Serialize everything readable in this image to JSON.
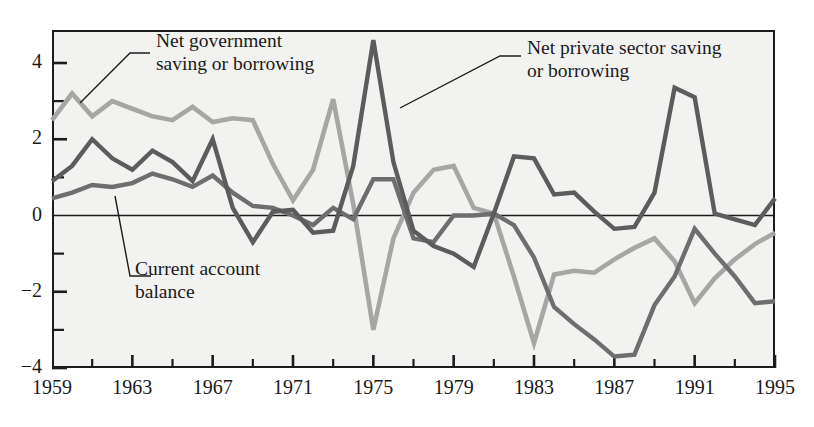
{
  "chart_data": {
    "type": "line",
    "title": "",
    "subtitle": "",
    "xlabel": "",
    "ylabel": "",
    "xlim": [
      1959,
      1995
    ],
    "ylim": [
      -4,
      5
    ],
    "grid": false,
    "legend_position": "inline-annotations",
    "yticks_major": [
      "4",
      "2",
      "0",
      "-2",
      "-4"
    ],
    "yticks_major_values": [
      4,
      2,
      0,
      -2,
      -4
    ],
    "yticks_minor_values": [
      3,
      1,
      -1,
      -3
    ],
    "xticks": [
      "1959",
      "1963",
      "1967",
      "1971",
      "1975",
      "1979",
      "1983",
      "1987",
      "1991",
      "1995"
    ],
    "xticks_values": [
      1959,
      1963,
      1967,
      1971,
      1975,
      1979,
      1983,
      1987,
      1991,
      1995
    ],
    "xticks_minor_values": [
      1961,
      1965,
      1969,
      1973,
      1977,
      1981,
      1985,
      1989,
      1993
    ],
    "x": [
      1959,
      1960,
      1961,
      1962,
      1963,
      1964,
      1965,
      1966,
      1967,
      1968,
      1969,
      1970,
      1971,
      1972,
      1973,
      1974,
      1975,
      1976,
      1977,
      1978,
      1979,
      1980,
      1981,
      1982,
      1983,
      1984,
      1985,
      1986,
      1987,
      1988,
      1989,
      1990,
      1991,
      1992,
      1993,
      1994,
      1995
    ],
    "series": [
      {
        "name": "Net private sector saving or borrowing",
        "color": "#5c5c5c",
        "values": [
          0.9,
          1.3,
          2.0,
          1.5,
          1.2,
          1.7,
          1.4,
          0.9,
          2.0,
          0.2,
          -0.7,
          0.1,
          0.15,
          -0.45,
          -0.4,
          1.3,
          4.6,
          1.4,
          -0.4,
          -0.8,
          -1.0,
          -1.35,
          0.05,
          1.55,
          1.5,
          0.55,
          0.6,
          0.1,
          -0.35,
          -0.3,
          0.6,
          3.35,
          3.1,
          0.05,
          -0.1,
          -0.25,
          0.45
        ]
      },
      {
        "name": "Net government saving or borrowing",
        "color": "#a6a6a4",
        "values": [
          2.5,
          3.2,
          2.6,
          3.0,
          2.8,
          2.6,
          2.5,
          2.85,
          2.45,
          2.55,
          2.5,
          1.35,
          0.4,
          1.2,
          3.05,
          0.3,
          -3.0,
          -0.6,
          0.6,
          1.2,
          1.3,
          0.2,
          0.05,
          -1.6,
          -3.35,
          -1.55,
          -1.45,
          -1.5,
          -1.15,
          -0.85,
          -0.6,
          -1.2,
          -2.3,
          -1.65,
          -1.15,
          -0.75,
          -0.45
        ]
      },
      {
        "name": "Current account balance",
        "color": "#6e6e6e",
        "values": [
          0.45,
          0.6,
          0.8,
          0.75,
          0.85,
          1.1,
          0.95,
          0.75,
          1.05,
          0.6,
          0.25,
          0.2,
          0.0,
          -0.25,
          0.2,
          -0.1,
          0.95,
          0.95,
          -0.6,
          -0.7,
          0.0,
          0.0,
          0.05,
          -0.25,
          -1.1,
          -2.4,
          -2.85,
          -3.25,
          -3.7,
          -3.65,
          -2.35,
          -1.6,
          -0.35,
          -1.0,
          -1.6,
          -2.3,
          -2.25
        ]
      }
    ]
  },
  "annotations": [
    {
      "name": "annotation-net-government",
      "line1": "Net government",
      "line2": "saving or borrowing"
    },
    {
      "name": "annotation-net-private",
      "line1": "Net private sector saving",
      "line2": "or borrowing"
    },
    {
      "name": "annotation-current-account",
      "line1": "Current account",
      "line2": "balance"
    }
  ]
}
